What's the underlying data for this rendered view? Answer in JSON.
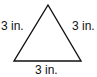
{
  "diagram": {
    "shape": "equilateral triangle",
    "sides": {
      "left": "3 in.",
      "right": "3 in.",
      "bottom": "3 in."
    },
    "stroke_color": "#111111",
    "fill_color": "#ffffff"
  }
}
